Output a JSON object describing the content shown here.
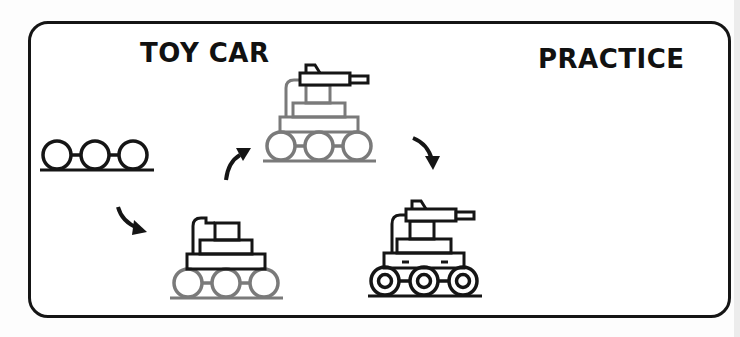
{
  "worksheet": {
    "title_left": "TOY CAR",
    "title_right": "PRACTICE",
    "colors": {
      "ink": "#151515",
      "guide": "#7a7a7a",
      "background": "#ffffff",
      "frame": "#151515"
    },
    "steps": [
      {
        "index": 1,
        "description": "track with three wheels",
        "new_part_color": "#151515"
      },
      {
        "index": 2,
        "description": "add body tiers and exhaust pipe",
        "new_part_color": "#151515",
        "guide_parts": "wheels"
      },
      {
        "index": 3,
        "description": "add turret gun",
        "new_part_color": "#151515",
        "guide_parts": "body and wheels"
      },
      {
        "index": 4,
        "description": "finished toy car with hubcaps and body details",
        "new_part_color": "#151515"
      }
    ],
    "arrows": [
      {
        "from": 1,
        "to": 2,
        "icon": "curved-arrow-down-right"
      },
      {
        "from": 2,
        "to": 3,
        "icon": "curved-arrow-up-right"
      },
      {
        "from": 3,
        "to": 4,
        "icon": "curved-arrow-down-right"
      }
    ]
  }
}
